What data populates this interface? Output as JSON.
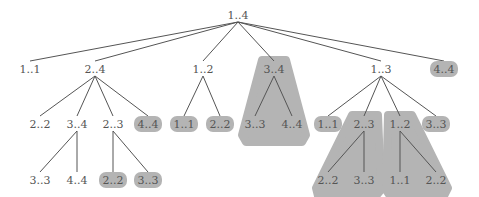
{
  "diagram": {
    "type": "tree",
    "highlight_color": "#b4b4b4",
    "line_color": "#555555",
    "text_color": "#555555",
    "nodes": [
      {
        "id": "root",
        "label": "1..4",
        "x": 238,
        "y": 16,
        "hl": false
      },
      {
        "id": "a",
        "label": "1..1",
        "x": 30,
        "y": 70,
        "hl": false
      },
      {
        "id": "b",
        "label": "2..4",
        "x": 95,
        "y": 70,
        "hl": false
      },
      {
        "id": "c",
        "label": "1..2",
        "x": 203,
        "y": 70,
        "hl": false
      },
      {
        "id": "d",
        "label": "3..4",
        "x": 274,
        "y": 70,
        "hl": false
      },
      {
        "id": "e",
        "label": "1..3",
        "x": 381,
        "y": 70,
        "hl": false
      },
      {
        "id": "f",
        "label": "4..4",
        "x": 444,
        "y": 70,
        "hl": true
      },
      {
        "id": "b1",
        "label": "2..2",
        "x": 40,
        "y": 125,
        "hl": false
      },
      {
        "id": "b2",
        "label": "3..4",
        "x": 77,
        "y": 125,
        "hl": false
      },
      {
        "id": "b3",
        "label": "2..3",
        "x": 113,
        "y": 125,
        "hl": false
      },
      {
        "id": "b4",
        "label": "4..4",
        "x": 148,
        "y": 125,
        "hl": true
      },
      {
        "id": "c1",
        "label": "1..1",
        "x": 184,
        "y": 125,
        "hl": true
      },
      {
        "id": "c2",
        "label": "2..2",
        "x": 220,
        "y": 125,
        "hl": true
      },
      {
        "id": "d1",
        "label": "3..3",
        "x": 255,
        "y": 125,
        "hl": false
      },
      {
        "id": "d2",
        "label": "4..4",
        "x": 292,
        "y": 125,
        "hl": false
      },
      {
        "id": "e1",
        "label": "1..1",
        "x": 328,
        "y": 125,
        "hl": true
      },
      {
        "id": "e2",
        "label": "2..3",
        "x": 364,
        "y": 125,
        "hl": false
      },
      {
        "id": "e3",
        "label": "1..2",
        "x": 400,
        "y": 125,
        "hl": false
      },
      {
        "id": "e4",
        "label": "3..3",
        "x": 436,
        "y": 125,
        "hl": true
      },
      {
        "id": "b21",
        "label": "3..3",
        "x": 40,
        "y": 181,
        "hl": false
      },
      {
        "id": "b22",
        "label": "4..4",
        "x": 77,
        "y": 181,
        "hl": false
      },
      {
        "id": "b31",
        "label": "2..2",
        "x": 113,
        "y": 181,
        "hl": true
      },
      {
        "id": "b32",
        "label": "3..3",
        "x": 148,
        "y": 181,
        "hl": true
      },
      {
        "id": "e21",
        "label": "2..2",
        "x": 328,
        "y": 181,
        "hl": false
      },
      {
        "id": "e22",
        "label": "3..3",
        "x": 364,
        "y": 181,
        "hl": false
      },
      {
        "id": "e31",
        "label": "1..1",
        "x": 400,
        "y": 181,
        "hl": false
      },
      {
        "id": "e32",
        "label": "2..2",
        "x": 436,
        "y": 181,
        "hl": false
      }
    ],
    "edges": [
      [
        "root",
        "a"
      ],
      [
        "root",
        "b"
      ],
      [
        "root",
        "c"
      ],
      [
        "root",
        "d"
      ],
      [
        "root",
        "e"
      ],
      [
        "root",
        "f"
      ],
      [
        "b",
        "b1"
      ],
      [
        "b",
        "b2"
      ],
      [
        "b",
        "b3"
      ],
      [
        "b",
        "b4"
      ],
      [
        "c",
        "c1"
      ],
      [
        "c",
        "c2"
      ],
      [
        "d",
        "d1"
      ],
      [
        "d",
        "d2"
      ],
      [
        "e",
        "e1"
      ],
      [
        "e",
        "e2"
      ],
      [
        "e",
        "e3"
      ],
      [
        "e",
        "e4"
      ],
      [
        "b2",
        "b21"
      ],
      [
        "b2",
        "b22"
      ],
      [
        "b3",
        "b31"
      ],
      [
        "b3",
        "b32"
      ],
      [
        "e2",
        "e21"
      ],
      [
        "e2",
        "e22"
      ],
      [
        "e3",
        "e31"
      ],
      [
        "e3",
        "e32"
      ]
    ],
    "highlight_regions": [
      {
        "name": "subtree-3..4",
        "points": "262,60 286,60 306,135 302,142 246,142 242,135"
      },
      {
        "name": "subtree-2..3",
        "points": "352,115 378,115 381,190 376,196 318,196 316,188"
      },
      {
        "name": "subtree-1..2",
        "points": "388,115 412,115 448,188 444,196 390,196 386,190"
      }
    ]
  }
}
